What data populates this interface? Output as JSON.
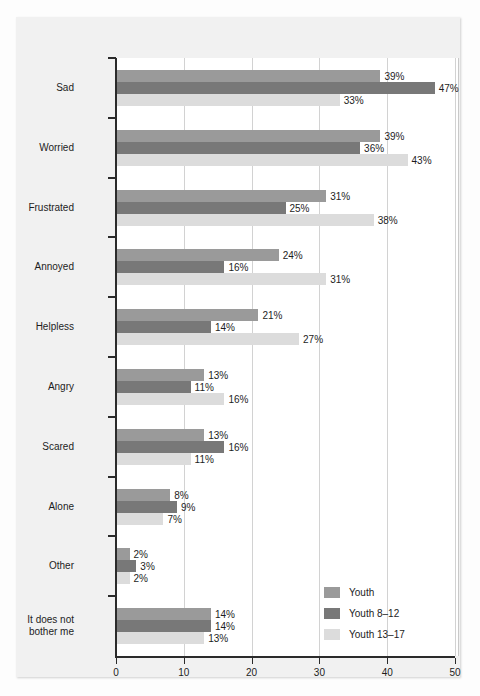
{
  "chart_data": {
    "type": "bar",
    "orientation": "horizontal",
    "title": "",
    "subtitle": "",
    "xlabel": "",
    "ylabel": "",
    "xlim": [
      0,
      50
    ],
    "xticks": [
      0,
      10,
      20,
      30,
      40,
      50
    ],
    "xtick_labels": [
      "0",
      "10",
      "20",
      "30",
      "40",
      "50"
    ],
    "grid": "vertical",
    "legend_position": "inner-bottom-right",
    "value_label_suffix": "%",
    "categories": [
      "Sad",
      "Worried",
      "Frustrated",
      "Annoyed",
      "Helpless",
      "Angry",
      "Scared",
      "Alone",
      "Other",
      "It does not\nbother me"
    ],
    "series": [
      {
        "name": "Youth",
        "color": "#9a9a9a",
        "values": [
          39,
          39,
          31,
          24,
          21,
          13,
          13,
          8,
          2,
          14
        ],
        "labels": [
          "39%",
          "39%",
          "31%",
          "24%",
          "21%",
          "13%",
          "13%",
          "8%",
          "2%",
          "14%"
        ]
      },
      {
        "name": "Youth 8–12",
        "color": "#787878",
        "values": [
          47,
          36,
          25,
          16,
          14,
          11,
          16,
          9,
          3,
          14
        ],
        "labels": [
          "47%",
          "36%",
          "25%",
          "16%",
          "14%",
          "11%",
          "16%",
          "9%",
          "3%",
          "14%"
        ]
      },
      {
        "name": "Youth 13–17",
        "color": "#dcdcdc",
        "values": [
          33,
          43,
          38,
          31,
          27,
          16,
          11,
          7,
          2,
          13
        ],
        "labels": [
          "33%",
          "43%",
          "38%",
          "31%",
          "27%",
          "16%",
          "11%",
          "7%",
          "2%",
          "13%"
        ]
      }
    ]
  },
  "legend": {
    "items": [
      {
        "label": "Youth",
        "color": "#9a9a9a"
      },
      {
        "label": "Youth 8–12",
        "color": "#787878"
      },
      {
        "label": "Youth 13–17",
        "color": "#dcdcdc"
      }
    ]
  },
  "colors": {
    "series_youth": "#9a9a9a",
    "series_youth_8_12": "#787878",
    "series_youth_13_17": "#dcdcdc",
    "axis": "#2b2b2b",
    "gridline": "#d2d2d2",
    "panel_background": "#f1f1f1",
    "plot_background": "#ffffff"
  }
}
